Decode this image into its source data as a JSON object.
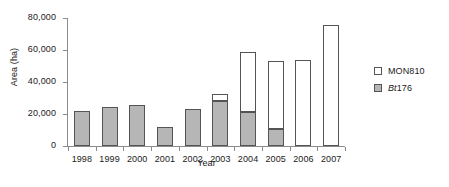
{
  "chart_data": {
    "type": "bar",
    "stacked": true,
    "title": "",
    "xlabel": "Year",
    "ylabel": "Area (ha)",
    "categories": [
      "1998",
      "1999",
      "2000",
      "2001",
      "2002",
      "2003",
      "2004",
      "2005",
      "2006",
      "2007"
    ],
    "series": [
      {
        "name": "Bt176",
        "name_italic_prefix": "Bt",
        "name_rest": "176",
        "color": "#b6b6b6",
        "values": [
          22000,
          24500,
          25500,
          12000,
          23000,
          28000,
          21500,
          10500,
          0,
          0
        ]
      },
      {
        "name": "MON810",
        "color": "#ffffff",
        "values": [
          0,
          0,
          0,
          0,
          0,
          4500,
          37500,
          42500,
          54000,
          75500
        ]
      }
    ],
    "totals": [
      22000,
      24500,
      25500,
      12000,
      23000,
      32500,
      59000,
      53000,
      54000,
      75500
    ],
    "ylim": [
      0,
      80000
    ],
    "ytick_values": [
      0,
      20000,
      40000,
      60000,
      80000
    ],
    "ytick_labels": [
      "0",
      "20,000",
      "40,000",
      "60,000",
      "80,000"
    ],
    "grid": false,
    "legend_position": "right",
    "legend_entries": [
      "MON810",
      "Bt176"
    ]
  },
  "axes": {
    "y_label": "Area (ha)",
    "x_label": "Year"
  },
  "legend": {
    "mon810": {
      "label": "MON810",
      "swatch_color": "#ffffff"
    },
    "bt176": {
      "label_italic": "Bt",
      "label_plain": "176",
      "swatch_color": "#b6b6b6"
    }
  }
}
